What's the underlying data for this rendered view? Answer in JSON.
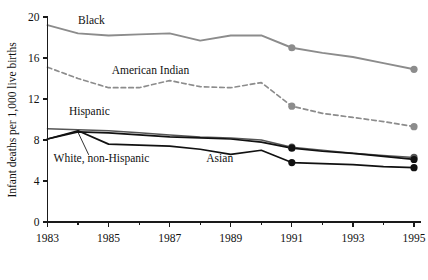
{
  "chart_data": {
    "type": "line",
    "title": "",
    "subtitle": "",
    "xlabel": "",
    "ylabel": "Infant deaths per 1,000 live births",
    "xlim": [
      1983,
      1995
    ],
    "ylim": [
      0,
      20
    ],
    "grid": false,
    "legend_position": "inline-annotations",
    "x": [
      1983,
      1984,
      1985,
      1986,
      1987,
      1988,
      1989,
      1990,
      1991,
      1992,
      1993,
      1994,
      1995
    ],
    "y_ticks": [
      0,
      4,
      8,
      12,
      16,
      20
    ],
    "y_tick_labels": [
      "0",
      "4",
      "8",
      "12",
      "16",
      "20"
    ],
    "x_ticks": [
      1983,
      1985,
      1987,
      1989,
      1991,
      1993,
      1995
    ],
    "x_tick_labels": [
      "1983",
      "1985",
      "1987",
      "1989",
      "1991",
      "1993",
      "1995"
    ],
    "x_minor_ticks": [
      1984,
      1986,
      1988,
      1990,
      1992,
      1994
    ],
    "series": [
      {
        "name": "Black",
        "label": "Black",
        "color": "#8c8c8c",
        "style": "solid",
        "width": 1.9,
        "values": [
          19.2,
          18.4,
          18.2,
          18.3,
          18.4,
          17.7,
          18.2,
          18.2,
          17.0,
          16.5,
          16.1,
          15.5,
          14.9
        ],
        "markers": [
          {
            "x": 1991,
            "y": 17.0
          },
          {
            "x": 1995,
            "y": 14.9
          }
        ],
        "label_x": 1984.0,
        "label_y": 19.3
      },
      {
        "name": "American Indian",
        "label": "American Indian",
        "color": "#8c8c8c",
        "style": "dashed",
        "width": 1.7,
        "values": [
          15.1,
          14.0,
          13.1,
          13.1,
          13.8,
          13.2,
          13.1,
          13.6,
          11.3,
          10.6,
          10.2,
          9.8,
          9.3
        ],
        "markers": [
          {
            "x": 1991,
            "y": 11.3
          },
          {
            "x": 1995,
            "y": 9.3
          }
        ],
        "label_x": 1985.1,
        "label_y": 14.4
      },
      {
        "name": "Hispanic",
        "label": "Hispanic",
        "color": "#555555",
        "style": "solid",
        "width": 1.5,
        "values": [
          9.1,
          9.0,
          8.9,
          8.7,
          8.5,
          8.3,
          8.2,
          8.0,
          7.3,
          7.0,
          6.7,
          6.5,
          6.3
        ],
        "markers": [
          {
            "x": 1991,
            "y": 7.3
          },
          {
            "x": 1995,
            "y": 6.3
          }
        ],
        "label_x": 1983.7,
        "label_y": 10.4
      },
      {
        "name": "White, non-Hispanic",
        "label": "White, non-Hispanic",
        "color": "#111111",
        "style": "solid",
        "width": 1.7,
        "values": [
          8.1,
          8.8,
          8.7,
          8.5,
          8.3,
          8.2,
          8.1,
          7.8,
          7.2,
          6.9,
          6.7,
          6.4,
          6.1
        ],
        "markers": [
          {
            "x": 1991,
            "y": 7.2
          },
          {
            "x": 1995,
            "y": 6.1
          }
        ],
        "label_x": 1983.2,
        "label_y": 5.9
      },
      {
        "name": "Asian",
        "label": "Asian",
        "color": "#111111",
        "style": "solid",
        "width": 1.7,
        "values": [
          8.1,
          8.9,
          7.6,
          7.5,
          7.4,
          7.1,
          6.6,
          7.0,
          5.8,
          5.7,
          5.6,
          5.4,
          5.3
        ],
        "markers": [
          {
            "x": 1991,
            "y": 5.8
          },
          {
            "x": 1995,
            "y": 5.3
          }
        ],
        "label_x": 1988.2,
        "label_y": 5.9
      }
    ],
    "annotations": [
      {
        "name": "black-label",
        "text": "Black"
      },
      {
        "name": "american-indian-label",
        "text": "American Indian"
      },
      {
        "name": "hispanic-label",
        "text": "Hispanic"
      },
      {
        "name": "white-non-hispanic-label",
        "text": "White, non-Hispanic"
      },
      {
        "name": "asian-label",
        "text": "Asian"
      }
    ]
  },
  "axes": {
    "y_title": "Infant deaths per 1,000 live births",
    "y_labels": [
      "20",
      "16",
      "12",
      "8",
      "4",
      "0"
    ],
    "x_labels": [
      "1983",
      "1985",
      "1987",
      "1989",
      "1991",
      "1993",
      "1995"
    ]
  },
  "colors": {
    "background": "#ffffff",
    "axis": "#1a1a1a",
    "gray_series": "#8c8c8c",
    "mid_series": "#555555",
    "dark_series": "#111111"
  }
}
